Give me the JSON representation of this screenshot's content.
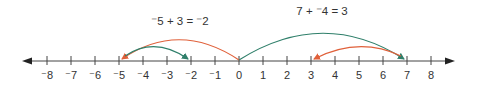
{
  "number_line": {
    "min": -8,
    "max": 8,
    "ticks": [
      {
        "value": -8,
        "label": "⁻8"
      },
      {
        "value": -7,
        "label": "⁻7"
      },
      {
        "value": -6,
        "label": "⁻6"
      },
      {
        "value": -5,
        "label": "⁻5"
      },
      {
        "value": -4,
        "label": "⁻4"
      },
      {
        "value": -3,
        "label": "⁻3"
      },
      {
        "value": -2,
        "label": "⁻2"
      },
      {
        "value": -1,
        "label": "⁻1"
      },
      {
        "value": 0,
        "label": "0"
      },
      {
        "value": 1,
        "label": "1"
      },
      {
        "value": 2,
        "label": "2"
      },
      {
        "value": 3,
        "label": "3"
      },
      {
        "value": 4,
        "label": "4"
      },
      {
        "value": 5,
        "label": "5"
      },
      {
        "value": 6,
        "label": "6"
      },
      {
        "value": 7,
        "label": "7"
      },
      {
        "value": 8,
        "label": "8"
      }
    ],
    "axis_color": "#444444"
  },
  "equations": [
    {
      "text": "⁻5 + 3 = ⁻2",
      "center_value": -2.5
    },
    {
      "text": "7 + ⁻4 = 3",
      "center_value": 3.5
    }
  ],
  "jumps": [
    {
      "id": "jump-0-to-neg5",
      "from": 0,
      "to": -5,
      "color": "#e0603a",
      "level": "high"
    },
    {
      "id": "jump-neg5-to-neg2",
      "from": -5,
      "to": -2,
      "color": "#2f7f6a",
      "level": "low"
    },
    {
      "id": "jump-0-to-7",
      "from": 0,
      "to": 7,
      "color": "#2f7f6a",
      "level": "high"
    },
    {
      "id": "jump-7-to-3",
      "from": 7,
      "to": 3,
      "color": "#e0603a",
      "level": "low"
    }
  ]
}
